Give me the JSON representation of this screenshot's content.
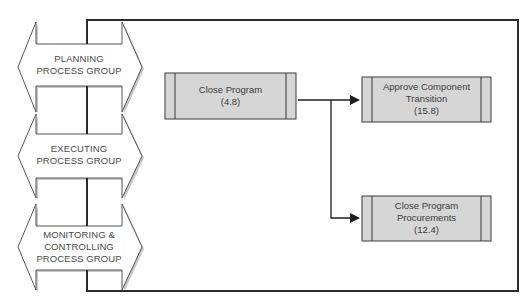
{
  "colors": {
    "frame": "#2b2b2b",
    "process_fill": "#d6d6d6",
    "process_stroke": "#3a3a3a",
    "arrow_stroke": "#555555",
    "arrow_fill": "#ffffff",
    "shadow": "#bdbdbd",
    "connector": "#1e1e1e"
  },
  "process_groups": [
    {
      "id": "planning",
      "lines": [
        "PLANNING",
        "PROCESS GROUP"
      ]
    },
    {
      "id": "executing",
      "lines": [
        "EXECUTING",
        "PROCESS GROUP"
      ]
    },
    {
      "id": "monitoring",
      "lines": [
        "MONITORING &",
        "CONTROLLING",
        "PROCESS GROUP"
      ]
    }
  ],
  "processes": [
    {
      "id": "close-program",
      "lines": [
        "Close Program",
        "(4.8)"
      ]
    },
    {
      "id": "approve-component-transition",
      "lines": [
        "Approve Component",
        "Transition",
        "(15.8)"
      ]
    },
    {
      "id": "close-program-procurements",
      "lines": [
        "Close Program",
        "Procurements",
        "(12.4)"
      ]
    }
  ],
  "connectors": [
    {
      "from": "close-program",
      "to": "approve-component-transition"
    },
    {
      "from": "close-program",
      "to": "close-program-procurements"
    }
  ]
}
